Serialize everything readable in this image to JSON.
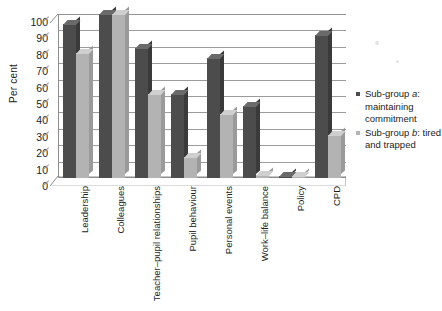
{
  "chart_data": {
    "type": "bar",
    "title": "",
    "xlabel": "",
    "ylabel": "Per cent",
    "ylim": [
      0,
      100
    ],
    "ytick_step": 10,
    "yticks": [
      "100",
      "90",
      "80",
      "70",
      "60",
      "50",
      "40",
      "30",
      "20",
      "10",
      "0"
    ],
    "grid": true,
    "legend_position": "right",
    "categories": [
      "Leadership",
      "Colleagues",
      "Teacher–pupil relationships",
      "Pupil behaviour",
      "Personal events",
      "Work–life balance",
      "Policy",
      "CPD"
    ],
    "series": [
      {
        "name": "Sub-group a: maintaining commitment",
        "color": "#4c4c4c",
        "values": [
          94,
          100,
          79,
          51,
          73,
          44,
          1,
          87
        ]
      },
      {
        "name": "Sub-group b: tired and trapped",
        "color": "#b3b3b3",
        "values": [
          76,
          100,
          51,
          13,
          39,
          2,
          1,
          26
        ]
      }
    ]
  },
  "legend": {
    "entries": [
      {
        "prefix": "Sub-group ",
        "italic": "a",
        "suffix": ": maintaining commitment"
      },
      {
        "prefix": "Sub-group ",
        "italic": "b",
        "suffix": ": tired and trapped"
      }
    ]
  }
}
